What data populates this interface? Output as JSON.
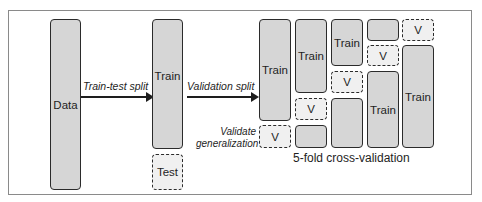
{
  "diagram": {
    "data_box": {
      "label": "Data"
    },
    "split": {
      "arrow_label": "Train-test split",
      "train_label": "Train",
      "test_label": "Test"
    },
    "validation": {
      "arrow_label": "Validation split",
      "note": "Validate generalization"
    },
    "cv": {
      "caption": "5-fold cross-validation",
      "train_label": "Train",
      "val_label": "V",
      "folds": [
        {
          "order": [
            "Train",
            "V"
          ]
        },
        {
          "order": [
            "Train",
            "V",
            "train-small"
          ]
        },
        {
          "order": [
            "Train",
            "V",
            "train-small"
          ]
        },
        {
          "order": [
            "train-small",
            "V",
            "Train"
          ]
        },
        {
          "order": [
            "V",
            "Train"
          ]
        }
      ]
    },
    "colors": {
      "train_fill": "#d6d6d6",
      "val_fill": "#f0f0f0",
      "border": "#2b2b2b"
    }
  }
}
